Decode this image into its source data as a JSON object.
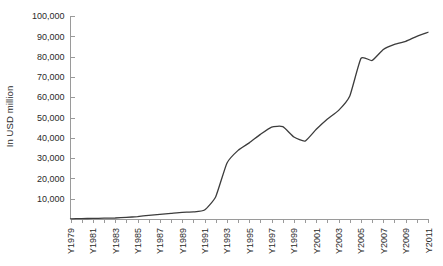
{
  "chart_data": {
    "type": "line",
    "title": "",
    "subtitle": "",
    "xlabel": "",
    "ylabel": "In USD million",
    "ylim": [
      0,
      100000
    ],
    "xlim": [
      "Y1979",
      "Y2011"
    ],
    "grid": false,
    "legend": null,
    "y_ticks": [
      0,
      10000,
      20000,
      30000,
      40000,
      50000,
      60000,
      70000,
      80000,
      90000,
      100000
    ],
    "y_tick_labels": [
      "",
      "10,000",
      "20,000",
      "30,000",
      "40,000",
      "50,000",
      "60,000",
      "70,000",
      "80,000",
      "90,000",
      "100,000"
    ],
    "x_tick_labels": [
      "Y1979",
      "Y1981",
      "Y1983",
      "Y1985",
      "Y1987",
      "Y1989",
      "Y1991",
      "Y1993",
      "Y1995",
      "Y1997",
      "Y1999",
      "Y2001",
      "Y2003",
      "Y2005",
      "Y2007",
      "Y2009",
      "Y2011"
    ],
    "x_tick_interval_years": 2,
    "categories": [
      "Y1979",
      "Y1980",
      "Y1981",
      "Y1982",
      "Y1983",
      "Y1984",
      "Y1985",
      "Y1986",
      "Y1987",
      "Y1988",
      "Y1989",
      "Y1990",
      "Y1991",
      "Y1992",
      "Y1993",
      "Y1994",
      "Y1995",
      "Y1996",
      "Y1997",
      "Y1998",
      "Y1999",
      "Y2000",
      "Y2001",
      "Y2002",
      "Y2003",
      "Y2004",
      "Y2005",
      "Y2006",
      "Y2007",
      "Y2008",
      "Y2009",
      "Y2010",
      "Y2011"
    ],
    "series": [
      {
        "name": "In USD million",
        "color": "#3c3c3c",
        "values": [
          100,
          200,
          300,
          400,
          500,
          800,
          1200,
          1800,
          2300,
          2800,
          3300,
          3500,
          4400,
          11000,
          27500,
          33800,
          37500,
          41700,
          45300,
          45500,
          40400,
          38400,
          44200,
          49300,
          53500,
          60600,
          79100,
          78100,
          83500,
          86000,
          87500,
          90000,
          92000
        ]
      }
    ]
  }
}
